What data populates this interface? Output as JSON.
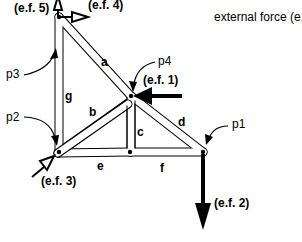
{
  "legend": {
    "text": "external force (e.f.)"
  },
  "points": [
    {
      "id": "p1",
      "label": "p1"
    },
    {
      "id": "p2",
      "label": "p2"
    },
    {
      "id": "p3",
      "label": "p3"
    },
    {
      "id": "p4",
      "label": "p4"
    }
  ],
  "bars": [
    {
      "id": "a",
      "label": "a"
    },
    {
      "id": "b",
      "label": "b"
    },
    {
      "id": "c",
      "label": "c"
    },
    {
      "id": "d",
      "label": "d"
    },
    {
      "id": "e",
      "label": "e"
    },
    {
      "id": "f",
      "label": "f"
    },
    {
      "id": "g",
      "label": "g"
    }
  ],
  "external_forces": [
    {
      "id": "ef1",
      "label": "(e.f. 1)",
      "style": "solid",
      "direction": "left",
      "applied_at": "p4"
    },
    {
      "id": "ef2",
      "label": "(e.f. 2)",
      "style": "solid",
      "direction": "down",
      "applied_at": "p1"
    },
    {
      "id": "ef3",
      "label": "(e.f. 3)",
      "style": "hollow",
      "direction": "up-right",
      "applied_at": "p2"
    },
    {
      "id": "ef4",
      "label": "(e.f. 4)",
      "style": "hollow",
      "direction": "right",
      "applied_at": "p3"
    },
    {
      "id": "ef5",
      "label": "(e.f. 5)",
      "style": "hollow",
      "direction": "up",
      "applied_at": "p3"
    }
  ],
  "colors": {
    "ink": "#000000",
    "bar_fill": "#ffffff",
    "background": "#ffffff"
  }
}
